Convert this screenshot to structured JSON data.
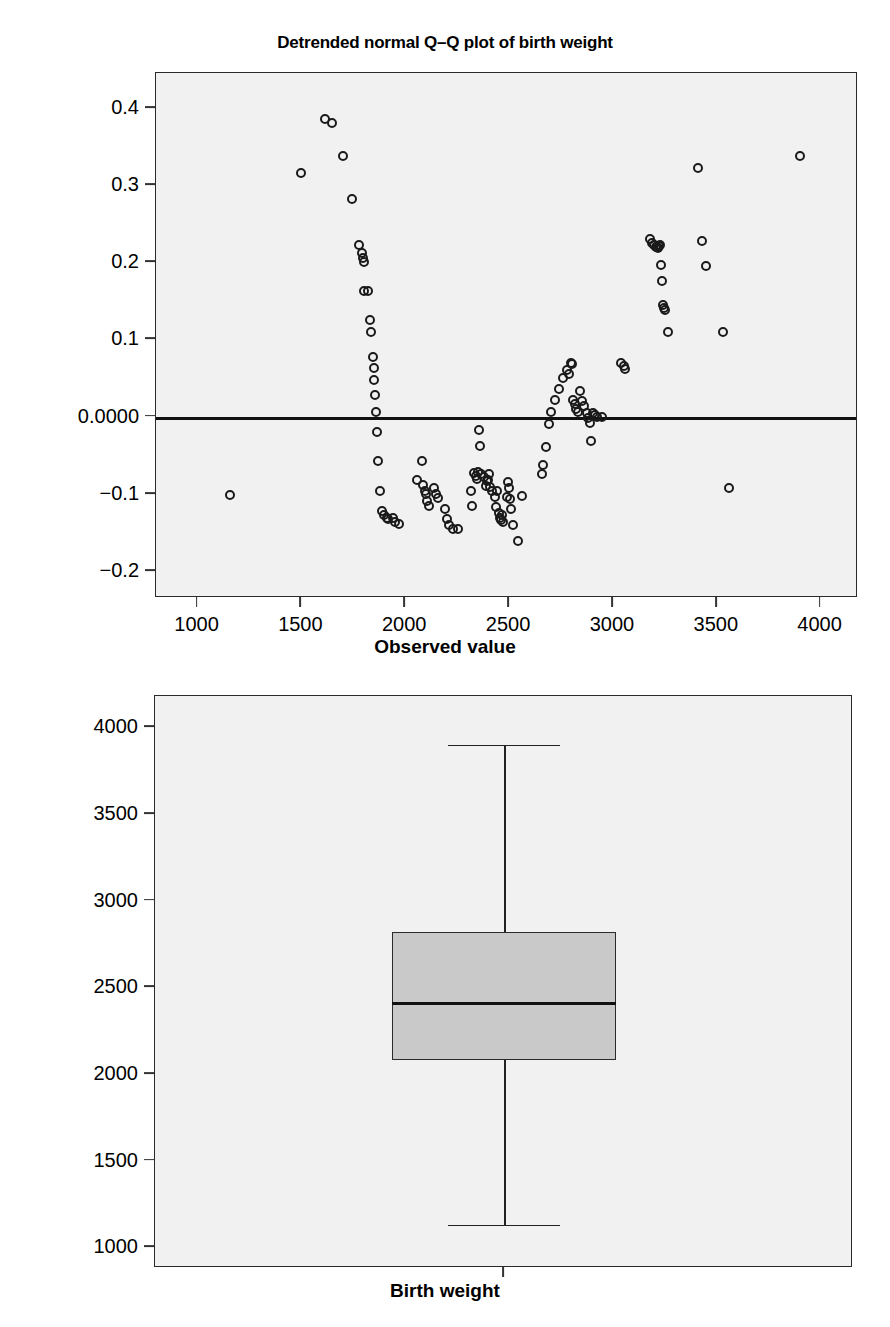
{
  "figure": {
    "background": "#ffffff",
    "panel_background": "#f1f1f1",
    "axis_color": "#2a2a2a",
    "marker_color": "#1a1a1a",
    "box_fill": "#c9c9c9"
  },
  "chart_data": [
    {
      "type": "scatter",
      "title": "Detrended normal Q–Q plot of birth weight",
      "xlabel": "Observed value",
      "ylabel": "Dev from Normal",
      "xlim": [
        800,
        4180
      ],
      "ylim": [
        -0.235,
        0.445
      ],
      "grid": false,
      "legend": null,
      "xticks": [
        1000,
        1500,
        2000,
        2500,
        3000,
        3500,
        4000
      ],
      "xticklabels": [
        "1000",
        "1500",
        "2000",
        "2500",
        "3000",
        "3500",
        "4000"
      ],
      "yticks": [
        0.4,
        0.3,
        0.2,
        0.1,
        0.0,
        -0.1,
        -0.2
      ],
      "yticklabels": [
        "0.4",
        "0.3",
        "0.2",
        "0.1",
        "0.0000",
        "−0.1",
        "−0.2"
      ],
      "reference_line": {
        "y": 0.0,
        "style": "solid",
        "width": 3
      },
      "marker": "open-circle",
      "points": [
        [
          1155,
          -0.102
        ],
        [
          1500,
          0.315
        ],
        [
          1615,
          0.385
        ],
        [
          1645,
          0.38
        ],
        [
          1700,
          0.337
        ],
        [
          1745,
          0.282
        ],
        [
          1775,
          0.222
        ],
        [
          1790,
          0.212
        ],
        [
          1795,
          0.205
        ],
        [
          1800,
          0.2
        ],
        [
          1800,
          0.162
        ],
        [
          1820,
          0.163
        ],
        [
          1830,
          0.125
        ],
        [
          1835,
          0.11
        ],
        [
          1845,
          0.077
        ],
        [
          1850,
          0.063
        ],
        [
          1852,
          0.047
        ],
        [
          1855,
          0.028
        ],
        [
          1858,
          0.006
        ],
        [
          1862,
          -0.02
        ],
        [
          1870,
          -0.057
        ],
        [
          1880,
          -0.096
        ],
        [
          1890,
          -0.122
        ],
        [
          1900,
          -0.128
        ],
        [
          1910,
          -0.132
        ],
        [
          1918,
          -0.133
        ],
        [
          1940,
          -0.131
        ],
        [
          1952,
          -0.136
        ],
        [
          1970,
          -0.139
        ],
        [
          2055,
          -0.082
        ],
        [
          2080,
          -0.057
        ],
        [
          2085,
          -0.089
        ],
        [
          2095,
          -0.096
        ],
        [
          2100,
          -0.1
        ],
        [
          2105,
          -0.11
        ],
        [
          2115,
          -0.116
        ],
        [
          2140,
          -0.092
        ],
        [
          2150,
          -0.1
        ],
        [
          2160,
          -0.106
        ],
        [
          2190,
          -0.12
        ],
        [
          2200,
          -0.133
        ],
        [
          2210,
          -0.14
        ],
        [
          2230,
          -0.145
        ],
        [
          2255,
          -0.145
        ],
        [
          2315,
          -0.096
        ],
        [
          2320,
          -0.116
        ],
        [
          2330,
          -0.073
        ],
        [
          2340,
          -0.077
        ],
        [
          2345,
          -0.081
        ],
        [
          2350,
          -0.072
        ],
        [
          2355,
          -0.018
        ],
        [
          2360,
          -0.038
        ],
        [
          2365,
          -0.075
        ],
        [
          2380,
          -0.078
        ],
        [
          2390,
          -0.09
        ],
        [
          2395,
          -0.083
        ],
        [
          2400,
          -0.082
        ],
        [
          2405,
          -0.075
        ],
        [
          2410,
          -0.091
        ],
        [
          2420,
          -0.096
        ],
        [
          2430,
          -0.104
        ],
        [
          2435,
          -0.117
        ],
        [
          2440,
          -0.096
        ],
        [
          2450,
          -0.125
        ],
        [
          2455,
          -0.131
        ],
        [
          2460,
          -0.134
        ],
        [
          2465,
          -0.128
        ],
        [
          2470,
          -0.136
        ],
        [
          2490,
          -0.104
        ],
        [
          2495,
          -0.085
        ],
        [
          2500,
          -0.093
        ],
        [
          2505,
          -0.107
        ],
        [
          2510,
          -0.12
        ],
        [
          2520,
          -0.14
        ],
        [
          2545,
          -0.161
        ],
        [
          2560,
          -0.103
        ],
        [
          2660,
          -0.074
        ],
        [
          2665,
          -0.063
        ],
        [
          2680,
          -0.039
        ],
        [
          2690,
          -0.01
        ],
        [
          2700,
          0.006
        ],
        [
          2720,
          0.022
        ],
        [
          2740,
          0.036
        ],
        [
          2760,
          0.05
        ],
        [
          2780,
          0.06
        ],
        [
          2790,
          0.055
        ],
        [
          2800,
          0.07
        ],
        [
          2805,
          0.068
        ],
        [
          2810,
          0.022
        ],
        [
          2815,
          0.016
        ],
        [
          2820,
          0.01
        ],
        [
          2830,
          0.006
        ],
        [
          2840,
          0.033
        ],
        [
          2850,
          0.02
        ],
        [
          2860,
          0.014
        ],
        [
          2875,
          0.004
        ],
        [
          2880,
          -0.002
        ],
        [
          2890,
          -0.008
        ],
        [
          2895,
          -0.032
        ],
        [
          2905,
          0.004
        ],
        [
          2915,
          0.002
        ],
        [
          2925,
          -0.001
        ],
        [
          2945,
          -0.001
        ],
        [
          3040,
          0.069
        ],
        [
          3055,
          0.065
        ],
        [
          3060,
          0.062
        ],
        [
          3180,
          0.23
        ],
        [
          3190,
          0.225
        ],
        [
          3200,
          0.222
        ],
        [
          3205,
          0.219
        ],
        [
          3210,
          0.219
        ],
        [
          3215,
          0.218
        ],
        [
          3220,
          0.221
        ],
        [
          3225,
          0.222
        ],
        [
          3230,
          0.196
        ],
        [
          3235,
          0.175
        ],
        [
          3240,
          0.145
        ],
        [
          3245,
          0.141
        ],
        [
          3250,
          0.138
        ],
        [
          3265,
          0.11
        ],
        [
          3410,
          0.322
        ],
        [
          3430,
          0.228
        ],
        [
          3450,
          0.195
        ],
        [
          3530,
          0.11
        ],
        [
          3560,
          -0.093
        ],
        [
          3900,
          0.338
        ]
      ]
    },
    {
      "type": "boxplot",
      "title": "",
      "xlabel": "Birth weight",
      "ylabel": "",
      "ylim": [
        880,
        4180
      ],
      "grid": false,
      "yticks": [
        4000,
        3500,
        3000,
        2500,
        2000,
        1500,
        1000
      ],
      "yticklabels": [
        "4000",
        "3500",
        "3000",
        "2500",
        "2000",
        "1500",
        "1000"
      ],
      "categories": [
        "Birth weight"
      ],
      "boxes": [
        {
          "label": "Birth weight",
          "whisker_high": 3900,
          "q3": 2820,
          "median": 2410,
          "q1": 2080,
          "whisker_low": 1130,
          "outliers": []
        }
      ]
    }
  ]
}
